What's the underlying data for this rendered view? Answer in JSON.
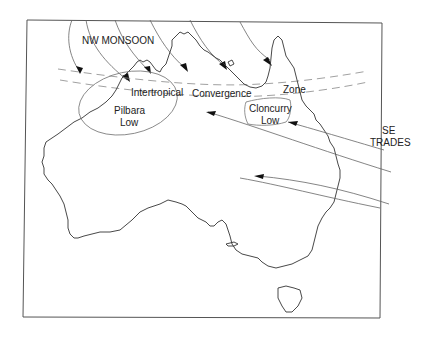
{
  "figure": {
    "labels": {
      "nw_monsoon": "NW MONSOON",
      "itcz_1": "Intertropical",
      "itcz_2": "Convergence",
      "itcz_3": "Zone",
      "pilbara_1": "Pilbara",
      "pilbara_2": "Low",
      "cloncurry_1": "Cloncurry",
      "cloncurry_2": "Low",
      "se_1": "SE",
      "se_2": "TRADES"
    },
    "colors": {
      "background": "#ffffff",
      "coastline": "#333333",
      "flow_lines": "#666666",
      "itcz_dashes": "#888888",
      "arrowheads": "#111111"
    }
  }
}
